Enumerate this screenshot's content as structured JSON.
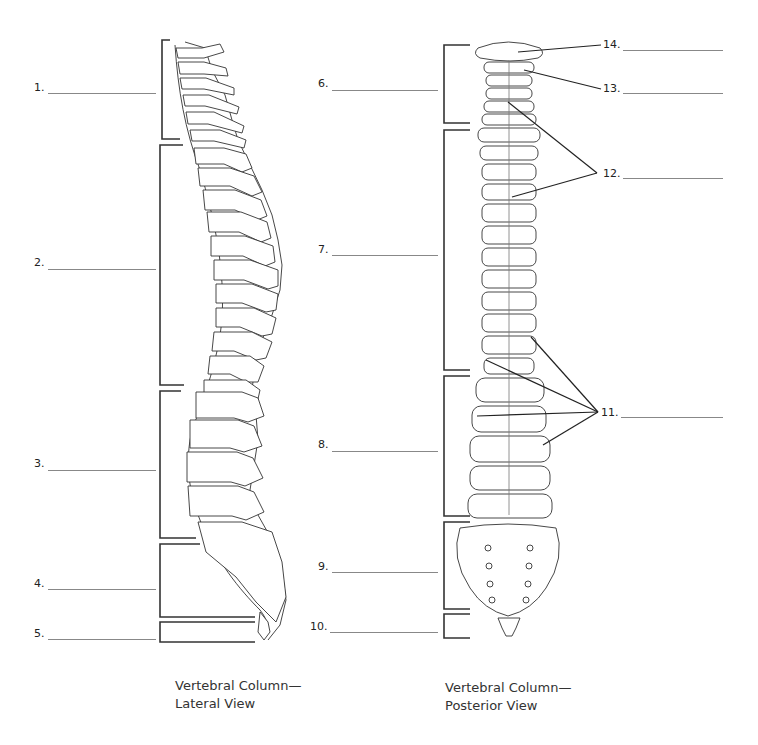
{
  "diagram": {
    "lateral_view": {
      "caption_line1": "Vertebral Column—",
      "caption_line2": "Lateral View",
      "labels": [
        {
          "num": "1.",
          "x": 34,
          "y": 88,
          "line_x": 48,
          "line_w": 108
        },
        {
          "num": "2.",
          "x": 34,
          "y": 263,
          "line_x": 48,
          "line_w": 108
        },
        {
          "num": "3.",
          "x": 34,
          "y": 464,
          "line_x": 48,
          "line_w": 108
        },
        {
          "num": "4.",
          "x": 34,
          "y": 583,
          "line_x": 48,
          "line_w": 108
        },
        {
          "num": "5.",
          "x": 34,
          "y": 632,
          "line_x": 48,
          "line_w": 108
        }
      ]
    },
    "posterior_view": {
      "caption_line1": "Vertebral Column—",
      "caption_line2": "Posterior View",
      "labels": [
        {
          "num": "6.",
          "x": 318,
          "y": 83,
          "line_x": 332,
          "line_w": 106
        },
        {
          "num": "7.",
          "x": 318,
          "y": 249,
          "line_x": 332,
          "line_w": 106
        },
        {
          "num": "8.",
          "x": 318,
          "y": 444,
          "line_x": 332,
          "line_w": 106
        },
        {
          "num": "9.",
          "x": 318,
          "y": 566,
          "line_x": 332,
          "line_w": 106
        },
        {
          "num": "10.",
          "x": 312,
          "y": 626,
          "line_x": 332,
          "line_w": 106
        }
      ],
      "right_labels": [
        {
          "num": "14.",
          "x": 603,
          "y": 44,
          "line_x": 623,
          "line_w": 100
        },
        {
          "num": "13.",
          "x": 603,
          "y": 88,
          "line_x": 623,
          "line_w": 100
        },
        {
          "num": "12.",
          "x": 603,
          "y": 173,
          "line_x": 623,
          "line_w": 100
        },
        {
          "num": "11.",
          "x": 601,
          "y": 412,
          "line_x": 621,
          "line_w": 102
        }
      ]
    },
    "colors": {
      "ink": "#222222",
      "blank_line": "#888888",
      "background": "#ffffff"
    }
  }
}
